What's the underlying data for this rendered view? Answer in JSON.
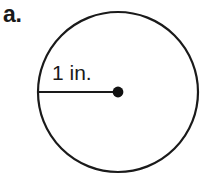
{
  "figure": {
    "part_label": "a.",
    "shape": "circle",
    "radius_label": "1 in.",
    "radius_value": 1,
    "radius_units": "in.",
    "stroke_color": "#1a1a1a",
    "fill_color": "#ffffff",
    "background_color": "#ffffff",
    "center_dot_color": "#111111",
    "circle": {
      "center_x": 118,
      "center_y": 92,
      "radius_x": 80,
      "radius_y": 81,
      "stroke_width": 2.2
    },
    "radius_line": {
      "x1": 39,
      "y1": 92,
      "x2": 118,
      "y2": 92,
      "stroke_width": 2.2
    },
    "center_dot": {
      "cx": 118,
      "cy": 92,
      "r": 5.4
    },
    "radius_label_position": {
      "x": 52,
      "y": 80
    }
  }
}
